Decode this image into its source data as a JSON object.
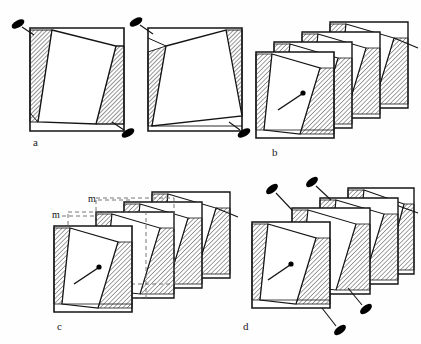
{
  "figure": {
    "background_color": "#fefefe",
    "stroke_color": "#141414",
    "hatch_color": "#3a3a3a",
    "marker_fill": "#000000",
    "dashed_color": "#555555"
  },
  "panels": [
    {
      "id": "a",
      "label": "a",
      "label_x": 33,
      "label_y": 142,
      "description": "Two separate plates each with rotated inner square and pin markers"
    },
    {
      "id": "b",
      "label": "b",
      "label_x": 272,
      "label_y": 152,
      "description": "Stack of four offset plates with needle indicator on front plate"
    },
    {
      "id": "c",
      "label": "c",
      "label_x": 57,
      "label_y": 326,
      "description": "Stack of plates with dashed outlines showing offset dimension m"
    },
    {
      "id": "d",
      "label": "d",
      "label_x": 243,
      "label_y": 326,
      "description": "Stack of plates with pin markers at plate corners"
    }
  ],
  "dimension_labels": [
    {
      "text": "m",
      "x": 56,
      "y": 215
    },
    {
      "text": "m",
      "x": 92,
      "y": 198
    }
  ],
  "icons": {
    "pin_marker": "ellipse-pin-icon",
    "needle": "needle-pointer-icon",
    "hatch": "diagonal-hatch-pattern"
  },
  "plates": {
    "panel_a": [
      {
        "x": 30,
        "y": 28,
        "w": 94,
        "h": 103,
        "rot_inner": -12
      },
      {
        "x": 148,
        "y": 28,
        "w": 94,
        "h": 103,
        "rot_inner": -16
      }
    ],
    "panel_b": [
      {
        "x": 330,
        "y": 22,
        "w": 78,
        "h": 90
      },
      {
        "x": 302,
        "y": 32,
        "w": 78,
        "h": 90
      },
      {
        "x": 274,
        "y": 42,
        "w": 78,
        "h": 90
      },
      {
        "x": 256,
        "y": 52,
        "w": 78,
        "h": 90
      }
    ],
    "panel_c": [
      {
        "x": 152,
        "y": 192,
        "w": 78,
        "h": 90
      },
      {
        "x": 124,
        "y": 202,
        "w": 78,
        "h": 90
      },
      {
        "x": 96,
        "y": 212,
        "w": 78,
        "h": 90
      },
      {
        "x": 54,
        "y": 226,
        "w": 78,
        "h": 90
      }
    ],
    "panel_d": [
      {
        "x": 348,
        "y": 188,
        "w": 78,
        "h": 90
      },
      {
        "x": 320,
        "y": 198,
        "w": 78,
        "h": 90
      },
      {
        "x": 292,
        "y": 208,
        "w": 78,
        "h": 90
      },
      {
        "x": 252,
        "y": 222,
        "w": 78,
        "h": 90
      }
    ]
  },
  "markers": {
    "panel_a": [
      {
        "cx": 18,
        "cy": 24,
        "angle": -30,
        "line_to_x": 33,
        "line_to_y": 34
      },
      {
        "cx": 127,
        "cy": 133,
        "angle": -30,
        "line_to_x": 112,
        "line_to_y": 122
      },
      {
        "cx": 136,
        "cy": 22,
        "angle": -30,
        "line_to_x": 152,
        "line_to_y": 33
      },
      {
        "cx": 242,
        "cy": 133,
        "angle": -30,
        "line_to_x": 228,
        "line_to_y": 122
      }
    ],
    "panel_d": [
      {
        "cx": 272,
        "cy": 190,
        "angle": -30,
        "line_to_x": 290,
        "line_to_y": 208
      },
      {
        "cx": 312,
        "cy": 183,
        "angle": -30,
        "line_to_x": 330,
        "line_to_y": 200
      },
      {
        "cx": 340,
        "cy": 330,
        "angle": -30,
        "line_to_x": 326,
        "line_to_y": 312
      },
      {
        "cx": 366,
        "cy": 309,
        "angle": -30,
        "line_to_x": 352,
        "line_to_y": 292
      }
    ]
  }
}
